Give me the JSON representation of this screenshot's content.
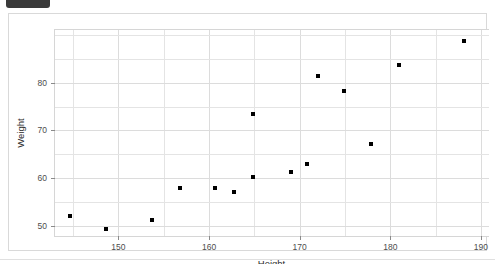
{
  "overlay": {
    "top_chip_label": ""
  },
  "chart_data": {
    "type": "scatter",
    "title": "",
    "xlabel": "Height",
    "ylabel": "Weight",
    "xlim": [
      143,
      191
    ],
    "ylim": [
      47.5,
      91
    ],
    "xticks": [
      150,
      160,
      170,
      180,
      190
    ],
    "yticks": [
      50,
      60,
      70,
      80
    ],
    "xtick_labels": [
      "150",
      "160",
      "170",
      "180",
      "190"
    ],
    "ytick_labels": [
      "50",
      "60",
      "70",
      "80"
    ],
    "grid": true,
    "legend": "none",
    "marker": {
      "shape": "square",
      "color": "#000000",
      "size": 4
    },
    "points": [
      {
        "x": 144.6,
        "y": 52.1
      },
      {
        "x": 148.6,
        "y": 49.4
      },
      {
        "x": 153.7,
        "y": 51.2
      },
      {
        "x": 156.8,
        "y": 57.9
      },
      {
        "x": 160.7,
        "y": 58.0
      },
      {
        "x": 162.8,
        "y": 57.1
      },
      {
        "x": 164.8,
        "y": 73.4
      },
      {
        "x": 164.8,
        "y": 60.3
      },
      {
        "x": 169.0,
        "y": 61.3
      },
      {
        "x": 170.8,
        "y": 62.9
      },
      {
        "x": 172.0,
        "y": 81.3
      },
      {
        "x": 174.9,
        "y": 78.3
      },
      {
        "x": 177.9,
        "y": 67.1
      },
      {
        "x": 181.0,
        "y": 83.6
      },
      {
        "x": 188.1,
        "y": 88.8
      }
    ],
    "n_points": 15
  }
}
